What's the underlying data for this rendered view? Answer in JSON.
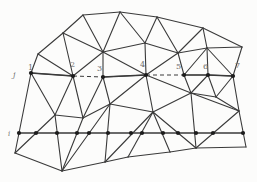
{
  "figure": {
    "width": 257,
    "height": 182,
    "background": "#fcfcfb",
    "edge_color": "#3a3a3a",
    "edge_width": 1.1,
    "dot_color": "#1c1c1c",
    "dot_radius": 2.1,
    "label_color": "#6e6e6e",
    "nodes": {
      "N1": [
        31,
        73
      ],
      "N2": [
        73,
        76
      ],
      "N3": [
        103,
        77
      ],
      "N4": [
        146,
        75
      ],
      "N5": [
        184,
        75
      ],
      "N6": [
        208,
        75
      ],
      "N7": [
        233,
        76
      ],
      "B_tl": [
        38,
        54
      ],
      "B_t0": [
        63,
        33
      ],
      "T1": [
        83,
        15
      ],
      "T2": [
        120,
        12
      ],
      "T3": [
        157,
        17
      ],
      "T4": [
        203,
        28
      ],
      "R1": [
        242,
        47
      ],
      "R2": [
        239,
        111
      ],
      "B_br": [
        246,
        147
      ],
      "B_b1": [
        196,
        148
      ],
      "B_b2": [
        170,
        152
      ],
      "B_b3": [
        128,
        157
      ],
      "B_b4": [
        105,
        162
      ],
      "B_b5": [
        62,
        171
      ],
      "B_bl": [
        15,
        153
      ],
      "C1": [
        103,
        52
      ],
      "U2": [
        145,
        43
      ],
      "U3": [
        178,
        53
      ],
      "U4": [
        207,
        48
      ],
      "L1": [
        55,
        115
      ],
      "L2": [
        83,
        118
      ],
      "L3": [
        110,
        104
      ],
      "L4": [
        153,
        112
      ],
      "L5": [
        191,
        93
      ],
      "L6": [
        216,
        97
      ]
    },
    "edges": [
      [
        "B_tl",
        "B_t0"
      ],
      [
        "B_t0",
        "T1"
      ],
      [
        "T1",
        "T2"
      ],
      [
        "T2",
        "T3"
      ],
      [
        "T3",
        "T4"
      ],
      [
        "T4",
        "R1"
      ],
      [
        "R1",
        "N7"
      ],
      [
        "N7",
        "R2"
      ],
      [
        "R2",
        "B_br"
      ],
      [
        "B_br",
        "B_b1"
      ],
      [
        "B_b1",
        "B_b2"
      ],
      [
        "B_b2",
        "B_b3"
      ],
      [
        "B_b3",
        "B_b4"
      ],
      [
        "B_b4",
        "B_b5"
      ],
      [
        "B_b5",
        "B_bl"
      ],
      [
        "B_bl",
        "N1"
      ],
      [
        "N1",
        "B_tl"
      ],
      [
        "N1",
        "N2"
      ],
      [
        "N3",
        "N4"
      ],
      [
        "N5",
        "N6"
      ],
      [
        "N6",
        "N7"
      ],
      [
        "N2",
        "B_tl"
      ],
      [
        "N2",
        "B_t0"
      ],
      [
        "N2",
        "C1"
      ],
      [
        "B_t0",
        "C1"
      ],
      [
        "T1",
        "C1"
      ],
      [
        "T2",
        "C1"
      ],
      [
        "C1",
        "U2"
      ],
      [
        "T2",
        "U2"
      ],
      [
        "T3",
        "U2"
      ],
      [
        "T3",
        "U3"
      ],
      [
        "U2",
        "U3"
      ],
      [
        "T4",
        "U3"
      ],
      [
        "T4",
        "U4"
      ],
      [
        "R1",
        "U4"
      ],
      [
        "U3",
        "U4"
      ],
      [
        "N7",
        "U4"
      ],
      [
        "N6",
        "U4"
      ],
      [
        "N5",
        "U4"
      ],
      [
        "N5",
        "U3"
      ],
      [
        "C1",
        "N3"
      ],
      [
        "C1",
        "N4"
      ],
      [
        "U2",
        "N4"
      ],
      [
        "U3",
        "N4"
      ],
      [
        "N2",
        "L1"
      ],
      [
        "N2",
        "L2"
      ],
      [
        "N1",
        "L1"
      ],
      [
        "B_bl",
        "L1"
      ],
      [
        "B_b5",
        "L1"
      ],
      [
        "L1",
        "L2"
      ],
      [
        "B_b5",
        "L2"
      ],
      [
        "N3",
        "L2"
      ],
      [
        "N3",
        "L3"
      ],
      [
        "L2",
        "L3"
      ],
      [
        "B_b5",
        "L3"
      ],
      [
        "B_b4",
        "L3"
      ],
      [
        "L3",
        "L4"
      ],
      [
        "B_b4",
        "L4"
      ],
      [
        "B_b3",
        "L4"
      ],
      [
        "B_b2",
        "L4"
      ],
      [
        "B_b1",
        "L4"
      ],
      [
        "N4",
        "L3"
      ],
      [
        "N4",
        "L4"
      ],
      [
        "N4",
        "L5"
      ],
      [
        "L4",
        "L5"
      ],
      [
        "N5",
        "L5"
      ],
      [
        "N6",
        "L5"
      ],
      [
        "N6",
        "L6"
      ],
      [
        "N7",
        "L6"
      ],
      [
        "L5",
        "L6"
      ],
      [
        "L6",
        "R2"
      ],
      [
        "L5",
        "R2"
      ],
      [
        "B_b1",
        "L5"
      ],
      [
        "B_b1",
        "R2"
      ]
    ],
    "line_j": {
      "label": "j",
      "label_pos": [
        13,
        77
      ],
      "label_size": 8,
      "solid_segments": [
        [
          "N1",
          "N2"
        ],
        [
          "N3",
          "N4"
        ],
        [
          "N5",
          "N6"
        ],
        [
          "N6",
          "N7"
        ]
      ],
      "dashed_segments": [
        [
          "N2",
          "N3"
        ],
        [
          "N4",
          "N5"
        ]
      ],
      "dash_pattern": "4 3",
      "nodes": [
        {
          "label": "1",
          "node": "N1",
          "label_pos": [
            28,
            70
          ]
        },
        {
          "label": "2",
          "node": "N2",
          "label_pos": [
            70,
            67
          ]
        },
        {
          "label": "3",
          "node": "N3",
          "label_pos": [
            97,
            71
          ]
        },
        {
          "label": "4",
          "node": "N4",
          "label_pos": [
            140,
            67
          ]
        },
        {
          "label": "5",
          "node": "N5",
          "label_pos": [
            176,
            69
          ]
        },
        {
          "label": "6",
          "node": "N6",
          "label_pos": [
            203,
            69
          ]
        },
        {
          "label": "7",
          "node": "N7",
          "label_pos": [
            235,
            68
          ]
        }
      ],
      "label_font_size": 8
    },
    "line_i": {
      "label": "i",
      "label_pos": [
        8,
        136
      ],
      "label_size": 7,
      "y": 133,
      "x_start": 19,
      "x_end": 243,
      "dot_xs": [
        19,
        36,
        57,
        77,
        89,
        108,
        131,
        142,
        163,
        178,
        196,
        213,
        243
      ]
    }
  }
}
